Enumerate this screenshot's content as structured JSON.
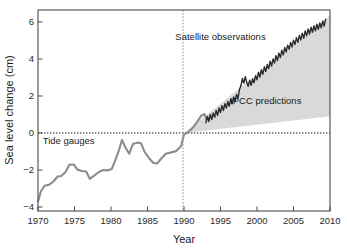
{
  "chart_data": {
    "type": "line",
    "title": "",
    "xlabel": "Year",
    "ylabel": "Sea level change (cm)",
    "xlim": [
      1970,
      2010
    ],
    "ylim": [
      -4,
      6.8
    ],
    "xticks": [
      1970,
      1975,
      1980,
      1985,
      1990,
      1995,
      2000,
      2005,
      2010
    ],
    "xtick_labels": [
      "1970",
      "1975",
      "1980",
      "1985",
      "1990",
      "1995",
      "2000",
      "2005",
      "2010"
    ],
    "yticks": [
      -4,
      -2,
      0,
      2,
      4,
      6
    ],
    "ytick_labels": [
      "−4",
      "−2",
      "0",
      "2",
      "4",
      "6"
    ],
    "grid": false,
    "legend_position": "inline-annotations",
    "zero_reference_line": {
      "y": 0,
      "style": "dotted",
      "color": "#111111"
    },
    "vertical_reference_line": {
      "x": 1990,
      "style": "dotted",
      "color": "#777777"
    },
    "annotations": [
      {
        "text": "Satellite observations",
        "x": 1995.0,
        "y": 5.05
      },
      {
        "text": "IPCC predictions",
        "x": 2001.2,
        "y": 1.55
      },
      {
        "text": "Tide gauges",
        "x": 1974.2,
        "y": -0.62
      }
    ],
    "series": [
      {
        "name": "Tide gauges",
        "type": "line",
        "color": "#8c8c8c",
        "linewidth": 2.1,
        "points": [
          [
            1970.0,
            -3.7
          ],
          [
            1970.4,
            -3.15
          ],
          [
            1970.9,
            -2.85
          ],
          [
            1971.5,
            -2.8
          ],
          [
            1972.1,
            -2.62
          ],
          [
            1972.7,
            -2.35
          ],
          [
            1973.2,
            -2.32
          ],
          [
            1973.8,
            -2.1
          ],
          [
            1974.3,
            -1.72
          ],
          [
            1974.9,
            -1.7
          ],
          [
            1975.4,
            -1.98
          ],
          [
            1976.0,
            -2.05
          ],
          [
            1976.6,
            -2.08
          ],
          [
            1977.1,
            -2.48
          ],
          [
            1977.7,
            -2.3
          ],
          [
            1978.3,
            -2.12
          ],
          [
            1978.9,
            -2.0
          ],
          [
            1979.5,
            -2.02
          ],
          [
            1980.1,
            -1.95
          ],
          [
            1980.6,
            -1.45
          ],
          [
            1981.1,
            -0.92
          ],
          [
            1981.5,
            -0.38
          ],
          [
            1982.0,
            -0.8
          ],
          [
            1982.5,
            -1.12
          ],
          [
            1983.0,
            -0.6
          ],
          [
            1983.6,
            -0.52
          ],
          [
            1984.1,
            -0.55
          ],
          [
            1984.6,
            -1.02
          ],
          [
            1985.2,
            -1.35
          ],
          [
            1985.8,
            -1.62
          ],
          [
            1986.3,
            -1.65
          ],
          [
            1986.9,
            -1.38
          ],
          [
            1987.5,
            -1.12
          ],
          [
            1988.2,
            -1.05
          ],
          [
            1988.9,
            -0.98
          ],
          [
            1989.6,
            -0.72
          ],
          [
            1990.0,
            -0.08
          ],
          [
            1990.6,
            0.05
          ],
          [
            1991.2,
            0.28
          ],
          [
            1991.8,
            0.6
          ],
          [
            1992.4,
            0.95
          ],
          [
            1992.8,
            1.02
          ],
          [
            1993.1,
            0.72
          ],
          [
            1993.4,
            0.8
          ]
        ]
      },
      {
        "name": "Satellite observations",
        "type": "line",
        "color": "#2b2b2b",
        "linewidth": 1.4,
        "points": [
          [
            1993.0,
            0.55
          ],
          [
            1993.2,
            0.9
          ],
          [
            1993.4,
            0.62
          ],
          [
            1993.6,
            1.0
          ],
          [
            1993.8,
            0.72
          ],
          [
            1994.0,
            1.08
          ],
          [
            1994.2,
            0.85
          ],
          [
            1994.4,
            1.22
          ],
          [
            1994.6,
            0.95
          ],
          [
            1994.8,
            1.35
          ],
          [
            1995.0,
            1.1
          ],
          [
            1995.2,
            1.48
          ],
          [
            1995.4,
            1.22
          ],
          [
            1995.6,
            1.58
          ],
          [
            1995.8,
            1.35
          ],
          [
            1996.0,
            1.7
          ],
          [
            1996.2,
            1.45
          ],
          [
            1996.4,
            1.82
          ],
          [
            1996.6,
            1.58
          ],
          [
            1996.8,
            1.95
          ],
          [
            1997.0,
            1.7
          ],
          [
            1997.2,
            2.08
          ],
          [
            1997.4,
            1.88
          ],
          [
            1997.6,
            2.35
          ],
          [
            1997.8,
            2.55
          ],
          [
            1998.0,
            2.95
          ],
          [
            1998.2,
            2.7
          ],
          [
            1998.4,
            3.05
          ],
          [
            1998.6,
            2.72
          ],
          [
            1998.8,
            2.52
          ],
          [
            1999.0,
            2.85
          ],
          [
            1999.2,
            2.58
          ],
          [
            1999.4,
            2.92
          ],
          [
            1999.6,
            2.72
          ],
          [
            1999.8,
            3.1
          ],
          [
            2000.0,
            2.88
          ],
          [
            2000.2,
            3.28
          ],
          [
            2000.4,
            3.02
          ],
          [
            2000.6,
            3.42
          ],
          [
            2000.8,
            3.18
          ],
          [
            2001.0,
            3.58
          ],
          [
            2001.2,
            3.32
          ],
          [
            2001.4,
            3.7
          ],
          [
            2001.6,
            3.48
          ],
          [
            2001.8,
            3.88
          ],
          [
            2002.0,
            3.62
          ],
          [
            2002.2,
            4.0
          ],
          [
            2002.4,
            3.78
          ],
          [
            2002.6,
            4.18
          ],
          [
            2002.8,
            3.92
          ],
          [
            2003.0,
            4.32
          ],
          [
            2003.2,
            4.08
          ],
          [
            2003.4,
            4.48
          ],
          [
            2003.6,
            4.22
          ],
          [
            2003.8,
            4.62
          ],
          [
            2004.0,
            4.38
          ],
          [
            2004.2,
            4.75
          ],
          [
            2004.4,
            4.52
          ],
          [
            2004.6,
            4.9
          ],
          [
            2004.8,
            4.65
          ],
          [
            2005.0,
            5.02
          ],
          [
            2005.2,
            4.78
          ],
          [
            2005.4,
            5.15
          ],
          [
            2005.6,
            4.9
          ],
          [
            2005.8,
            5.28
          ],
          [
            2006.0,
            5.02
          ],
          [
            2006.2,
            5.4
          ],
          [
            2006.4,
            5.12
          ],
          [
            2006.6,
            5.52
          ],
          [
            2006.8,
            5.25
          ],
          [
            2007.0,
            5.62
          ],
          [
            2007.2,
            5.35
          ],
          [
            2007.4,
            5.72
          ],
          [
            2007.6,
            5.45
          ],
          [
            2007.8,
            5.8
          ],
          [
            2008.0,
            5.52
          ],
          [
            2008.2,
            5.88
          ],
          [
            2008.4,
            5.6
          ],
          [
            2008.6,
            5.95
          ],
          [
            2008.8,
            5.68
          ],
          [
            2009.0,
            6.05
          ],
          [
            2009.2,
            5.78
          ],
          [
            2009.4,
            6.15
          ]
        ]
      }
    ],
    "bands": [
      {
        "name": "IPCC predictions",
        "type": "envelope",
        "color": "#d9d9d9",
        "x": [
          1990,
          2010
        ],
        "upper": [
          0.0,
          6.35
        ],
        "lower": [
          0.0,
          0.9
        ]
      }
    ]
  },
  "figure": {
    "xlabel": "Year",
    "ylabel": "Sea level change (cm)"
  }
}
